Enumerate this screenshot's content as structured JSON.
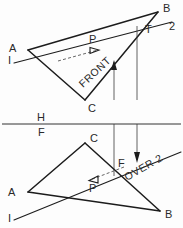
{
  "drawing": {
    "title": "Piercing point of line 1-2 with plane ABC",
    "ink_color": "#1c1c1c",
    "paper_color": "#fdfdfd",
    "views": {
      "top": {
        "name": "FRONT",
        "annotation": "FRONT",
        "vertices": {
          "A": "A",
          "B": "B",
          "C": "C",
          "P": "P",
          "T": "T",
          "line_start": "I",
          "line_end": "2"
        }
      },
      "bottom": {
        "name": "OVER 2",
        "annotation": "OVER 2",
        "vertices": {
          "A": "A",
          "B": "B",
          "C": "C",
          "P": "P",
          "F": "F",
          "line_start": "I",
          "line_end": "2"
        }
      }
    },
    "reference_line": {
      "upper_label": "H",
      "lower_label": "F"
    }
  }
}
